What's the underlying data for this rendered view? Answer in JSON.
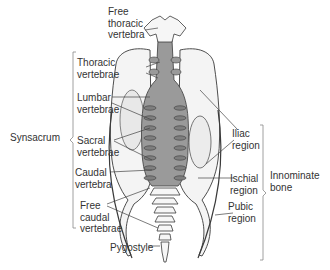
{
  "diagram": {
    "labels": {
      "free_thoracic_vertebra": "Free\nthoracic\nvertebra",
      "thoracic_vertebrae": "Thoracic\nvertebrae",
      "lumbar_vertebrae": "Lumbar\nvertebrae",
      "synsacrum": "Synsacrum",
      "sacral_vertebrae": "Sacral\nvertebrae",
      "caudal_vertebra": "Caudal\nvertebra",
      "free_caudal_vertebrae": "Free\ncaudal\nvertebrae",
      "pygostyle": "Pygostyle",
      "iliac_region": "Iliac\nregion",
      "innominate_bone": "Innominate\nbone",
      "ischial_region": "Ischial\nregion",
      "pubic_region": "Pubic\nregion"
    },
    "groups": {
      "synsacrum_bracket": [
        "thoracic_vertebrae",
        "lumbar_vertebrae",
        "sacral_vertebrae",
        "caudal_vertebra"
      ],
      "innominate_bracket": [
        "iliac_region",
        "ischial_region",
        "pubic_region"
      ]
    },
    "colors": {
      "bone_fill": "#f2f2f2",
      "synsacrum_fill": "#9a9a9a",
      "outline": "#3a3a3a",
      "leader_line": "#444444",
      "text": "#333333"
    }
  }
}
